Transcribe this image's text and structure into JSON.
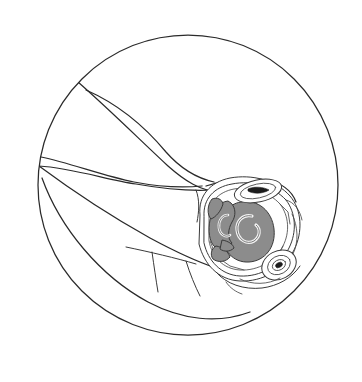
{
  "figure": {
    "view_shape": "circle",
    "background_color": "#ffffff",
    "line_color": "#2b2b2b",
    "fill_gray": "#8c8c8c",
    "fill_dark": "#1d1d1d",
    "fill_white": "#ffffff"
  },
  "viewport": {
    "width": 362,
    "height": 382,
    "circle_center_x": 188,
    "circle_center_y": 185,
    "circle_radius": 150
  },
  "regions": [
    {
      "name": "field-of-view-circle",
      "kind": "outline",
      "label": "Circular viewing field"
    },
    {
      "name": "upper-tissue-plane",
      "kind": "outline",
      "label": "Upper tissue plane"
    },
    {
      "name": "fascial-band-upper",
      "kind": "outline",
      "label": "Upper fascial band"
    },
    {
      "name": "fascial-band-lower",
      "kind": "outline",
      "label": "Lower fascial band"
    },
    {
      "name": "muscle-belly",
      "kind": "outline",
      "label": "Muscle belly contour"
    },
    {
      "name": "tendon-sheath",
      "kind": "outline",
      "label": "Tendon sheath"
    },
    {
      "name": "neurovascular-bundle",
      "kind": "detail",
      "label": "Neurovascular bundle"
    },
    {
      "name": "vessel-large-right",
      "kind": "filled",
      "fill": "#8c8c8c",
      "label": "Large vessel (right)"
    },
    {
      "name": "vessel-left",
      "kind": "filled",
      "fill": "#8c8c8c",
      "label": "Vessel (left)"
    },
    {
      "name": "vessel-small-lower-left",
      "kind": "filled",
      "fill": "#8c8c8c",
      "label": "Small vessel (lower left)"
    },
    {
      "name": "vessel-sliver-left",
      "kind": "filled",
      "fill": "#8c8c8c",
      "label": "Vessel sliver (left)"
    },
    {
      "name": "lumen-dark-upper",
      "kind": "filled",
      "fill": "#1d1d1d",
      "label": "Dark lumen (upper)"
    },
    {
      "name": "lumen-dark-lower-right",
      "kind": "filled",
      "fill": "#1d1d1d",
      "label": "Dark lumen (lower right)"
    }
  ],
  "annotations": {
    "labels": [],
    "scale_bar": null,
    "caption": ""
  }
}
